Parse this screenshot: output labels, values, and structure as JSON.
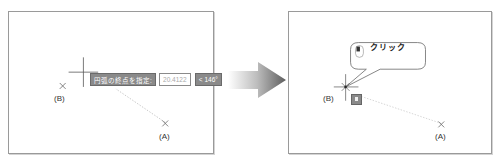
{
  "left_panel": {
    "point_b_label": "(B)",
    "point_a_label": "(A)",
    "tooltip": {
      "prompt": "円弧の終点を指定:",
      "value": "20.4122",
      "angle": "< 146°"
    }
  },
  "transition_arrow": {
    "icon": "arrow-right-icon"
  },
  "right_panel": {
    "point_b_label": "(B)",
    "point_a_label": "(A)",
    "callout": {
      "icon": "mouse-left-click-icon",
      "text": "クリック"
    },
    "snap_marker": "endpoint-snap-icon"
  },
  "colors": {
    "frame_border": "#9a9a9a",
    "tooltip_bg": "#8a8a8a",
    "arrow_gradient_start": "#f2f2f2",
    "arrow_gradient_end": "#666666"
  }
}
